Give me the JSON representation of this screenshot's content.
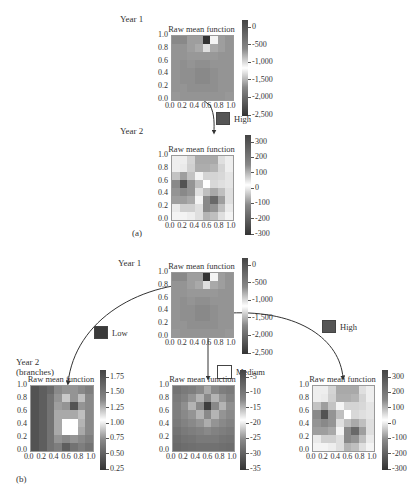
{
  "figure": {
    "part_a_label": "(a)",
    "part_b_label": "(b)",
    "year1_label": "Year 1",
    "year2_label": "Year 2",
    "year2_branches_label_1": "Year 2",
    "year2_branches_label_2": "(branches)"
  },
  "legend": {
    "high": {
      "label": "High",
      "color": "#555555"
    },
    "low": {
      "label": "Low",
      "color": "#3a3a3a"
    },
    "medium": {
      "label": "Medium",
      "color": "#ffffff"
    }
  },
  "chart_data": [
    {
      "id": "a-year1",
      "type": "heatmap",
      "title": "Raw mean function",
      "x_ticks": [
        "0.0",
        "0.2",
        "0.4",
        "0.6",
        "0.8",
        "1.0"
      ],
      "y_ticks": [
        "1.0",
        "0.8",
        "0.6",
        "0.4",
        "0.2",
        "0.0"
      ],
      "colorbar_ticks": [
        "0",
        "-500",
        "-1,000",
        "-1,500",
        "-2,000",
        "-2,500"
      ],
      "grid": [
        [
          0.45,
          0.45,
          0.55,
          0.55,
          0.05,
          0.95,
          0.55,
          0.5
        ],
        [
          0.5,
          0.5,
          0.55,
          0.6,
          0.85,
          0.6,
          0.55,
          0.5
        ],
        [
          0.5,
          0.5,
          0.52,
          0.52,
          0.52,
          0.52,
          0.5,
          0.5
        ],
        [
          0.5,
          0.48,
          0.5,
          0.48,
          0.48,
          0.5,
          0.5,
          0.5
        ],
        [
          0.5,
          0.48,
          0.48,
          0.45,
          0.45,
          0.48,
          0.5,
          0.5
        ],
        [
          0.5,
          0.48,
          0.48,
          0.45,
          0.45,
          0.48,
          0.5,
          0.5
        ],
        [
          0.5,
          0.5,
          0.48,
          0.48,
          0.48,
          0.48,
          0.5,
          0.5
        ],
        [
          0.52,
          0.5,
          0.5,
          0.5,
          0.5,
          0.5,
          0.5,
          0.52
        ]
      ]
    },
    {
      "id": "a-year2",
      "type": "heatmap",
      "title": "Raw mean function",
      "x_ticks": [
        "0.0",
        "0.2",
        "0.4",
        "0.6",
        "0.8",
        "1.0"
      ],
      "y_ticks": [
        "1.0",
        "0.8",
        "0.6",
        "0.4",
        "0.2",
        "0.0"
      ],
      "colorbar_ticks": [
        "300",
        "200",
        "100",
        "0",
        "-100",
        "-200",
        "-300"
      ],
      "grid": [
        [
          0.92,
          0.92,
          0.8,
          0.6,
          0.6,
          0.6,
          0.85,
          0.92
        ],
        [
          0.92,
          0.9,
          0.78,
          0.62,
          0.62,
          0.65,
          0.8,
          0.92
        ],
        [
          0.72,
          0.55,
          0.72,
          0.95,
          0.8,
          0.8,
          0.82,
          0.88
        ],
        [
          0.45,
          0.2,
          0.5,
          0.7,
          1.0,
          0.82,
          0.85,
          0.88
        ],
        [
          0.5,
          0.45,
          0.5,
          0.85,
          0.7,
          0.6,
          0.7,
          0.85
        ],
        [
          0.55,
          0.55,
          0.6,
          0.95,
          0.45,
          0.3,
          0.55,
          0.85
        ],
        [
          0.9,
          0.78,
          0.78,
          0.85,
          0.45,
          0.5,
          0.7,
          0.9
        ],
        [
          0.95,
          0.95,
          0.92,
          0.85,
          0.65,
          0.7,
          0.85,
          0.95
        ]
      ]
    },
    {
      "id": "b-year1",
      "type": "heatmap",
      "title": "Raw mean function",
      "x_ticks": [
        "0.0",
        "0.2",
        "0.4",
        "0.6",
        "0.8",
        "1.0"
      ],
      "y_ticks": [
        "1.0",
        "0.8",
        "0.6",
        "0.4",
        "0.2",
        "0.0"
      ],
      "colorbar_ticks": [
        "0",
        "-500",
        "-1,000",
        "-1,500",
        "-2,000",
        "-2,500"
      ],
      "grid": [
        [
          0.45,
          0.45,
          0.55,
          0.55,
          0.05,
          0.95,
          0.55,
          0.5
        ],
        [
          0.5,
          0.5,
          0.55,
          0.6,
          0.85,
          0.6,
          0.55,
          0.5
        ],
        [
          0.5,
          0.5,
          0.52,
          0.52,
          0.52,
          0.52,
          0.5,
          0.5
        ],
        [
          0.5,
          0.48,
          0.5,
          0.48,
          0.48,
          0.5,
          0.5,
          0.5
        ],
        [
          0.5,
          0.48,
          0.48,
          0.45,
          0.45,
          0.48,
          0.5,
          0.5
        ],
        [
          0.5,
          0.48,
          0.48,
          0.45,
          0.45,
          0.48,
          0.5,
          0.5
        ],
        [
          0.5,
          0.5,
          0.48,
          0.48,
          0.48,
          0.48,
          0.5,
          0.5
        ],
        [
          0.52,
          0.5,
          0.5,
          0.5,
          0.5,
          0.5,
          0.5,
          0.52
        ]
      ]
    },
    {
      "id": "b-low",
      "type": "heatmap",
      "title": "Raw mean function",
      "x_ticks": [
        "0.0",
        "0.2",
        "0.4",
        "0.6",
        "0.8",
        "1.0"
      ],
      "y_ticks": [
        "1.0",
        "0.8",
        "0.6",
        "0.4",
        "0.2",
        "0.0"
      ],
      "colorbar_ticks": [
        "1.75",
        "1.50",
        "1.25",
        "1.00",
        "0.75",
        "0.50",
        "0.25"
      ],
      "grid": [
        [
          0.2,
          0.25,
          0.3,
          0.45,
          0.5,
          0.5,
          0.45,
          0.4
        ],
        [
          0.2,
          0.25,
          0.35,
          0.5,
          0.75,
          0.5,
          0.7,
          0.45
        ],
        [
          0.2,
          0.25,
          0.35,
          0.55,
          0.5,
          0.2,
          0.5,
          0.45
        ],
        [
          0.2,
          0.25,
          0.35,
          0.6,
          0.6,
          0.6,
          0.7,
          0.45
        ],
        [
          0.2,
          0.25,
          0.35,
          0.6,
          1.0,
          1.0,
          0.65,
          0.45
        ],
        [
          0.2,
          0.25,
          0.35,
          0.6,
          1.0,
          1.0,
          0.6,
          0.45
        ],
        [
          0.2,
          0.25,
          0.35,
          0.5,
          0.45,
          0.5,
          0.45,
          0.4
        ],
        [
          0.2,
          0.25,
          0.35,
          0.4,
          0.25,
          0.35,
          0.4,
          0.35
        ]
      ]
    },
    {
      "id": "b-medium",
      "type": "heatmap",
      "title": "Raw mean function",
      "x_ticks": [
        "0.0",
        "0.2",
        "0.4",
        "0.6",
        "0.8",
        "1.0"
      ],
      "y_ticks": [
        "1.0",
        "0.8",
        "0.6",
        "0.4",
        "0.2",
        "0.0"
      ],
      "colorbar_ticks": [
        "-5",
        "-10",
        "-15",
        "-20",
        "-25",
        "-30",
        "-35"
      ],
      "grid": [
        [
          0.35,
          0.38,
          0.4,
          0.45,
          0.6,
          0.45,
          0.4,
          0.38
        ],
        [
          0.38,
          0.42,
          0.5,
          0.65,
          0.45,
          0.65,
          0.5,
          0.42
        ],
        [
          0.4,
          0.48,
          0.65,
          0.45,
          0.1,
          0.45,
          0.65,
          0.48
        ],
        [
          0.4,
          0.45,
          0.5,
          0.65,
          0.45,
          0.65,
          0.5,
          0.45
        ],
        [
          0.38,
          0.42,
          0.45,
          0.5,
          0.62,
          0.5,
          0.45,
          0.42
        ],
        [
          0.35,
          0.38,
          0.4,
          0.42,
          0.45,
          0.42,
          0.4,
          0.38
        ],
        [
          0.32,
          0.35,
          0.36,
          0.38,
          0.38,
          0.38,
          0.36,
          0.35
        ],
        [
          0.3,
          0.32,
          0.33,
          0.34,
          0.34,
          0.34,
          0.33,
          0.32
        ]
      ]
    },
    {
      "id": "b-high",
      "type": "heatmap",
      "title": "Raw mean function",
      "x_ticks": [
        "0.0",
        "0.2",
        "0.4",
        "0.6",
        "0.8",
        "1.0"
      ],
      "y_ticks": [
        "1.0",
        "0.8",
        "0.6",
        "0.4",
        "0.2",
        "0.0"
      ],
      "colorbar_ticks": [
        "300",
        "200",
        "100",
        "0",
        "-100",
        "-200",
        "-300"
      ],
      "grid": [
        [
          0.92,
          0.92,
          0.8,
          0.6,
          0.6,
          0.6,
          0.85,
          0.92
        ],
        [
          0.92,
          0.9,
          0.78,
          0.62,
          0.62,
          0.65,
          0.8,
          0.92
        ],
        [
          0.72,
          0.55,
          0.72,
          0.95,
          0.8,
          0.8,
          0.82,
          0.88
        ],
        [
          0.45,
          0.2,
          0.5,
          0.7,
          1.0,
          0.82,
          0.85,
          0.88
        ],
        [
          0.5,
          0.45,
          0.5,
          0.85,
          0.7,
          0.6,
          0.7,
          0.85
        ],
        [
          0.55,
          0.55,
          0.6,
          0.95,
          0.45,
          0.3,
          0.55,
          0.85
        ],
        [
          0.9,
          0.78,
          0.78,
          0.85,
          0.45,
          0.5,
          0.7,
          0.9
        ],
        [
          0.95,
          0.95,
          0.92,
          0.85,
          0.65,
          0.7,
          0.85,
          0.95
        ]
      ]
    }
  ]
}
